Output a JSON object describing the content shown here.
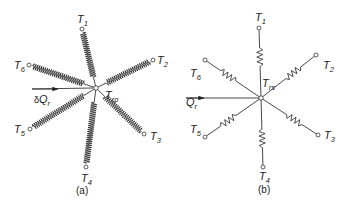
{
  "diagram_a": {
    "caption": "(a)",
    "center_label": {
      "main": "T",
      "sub": "rp"
    },
    "heat_flow_label": {
      "prefix": "δ",
      "main": "Q",
      "sub": "r"
    },
    "element_type": "spring (thermal resistance network, coiled)",
    "terminals": [
      {
        "main": "T",
        "sub": "1"
      },
      {
        "main": "T",
        "sub": "2"
      },
      {
        "main": "T",
        "sub": "3"
      },
      {
        "main": "T",
        "sub": "4"
      },
      {
        "main": "T",
        "sub": "5"
      },
      {
        "main": "T",
        "sub": "6"
      }
    ]
  },
  "diagram_b": {
    "caption": "(b)",
    "center_label": {
      "main": "T",
      "sub": "rs"
    },
    "heat_flow_label": {
      "main": "Q",
      "sub": "r"
    },
    "element_type": "resistor (zig-zag)",
    "terminals": [
      {
        "main": "T",
        "sub": "1"
      },
      {
        "main": "T",
        "sub": "2"
      },
      {
        "main": "T",
        "sub": "3"
      },
      {
        "main": "T",
        "sub": "4"
      },
      {
        "main": "T",
        "sub": "5"
      },
      {
        "main": "T",
        "sub": "6"
      }
    ]
  },
  "colors": {
    "ink": "#222222",
    "background": "#ffffff"
  }
}
